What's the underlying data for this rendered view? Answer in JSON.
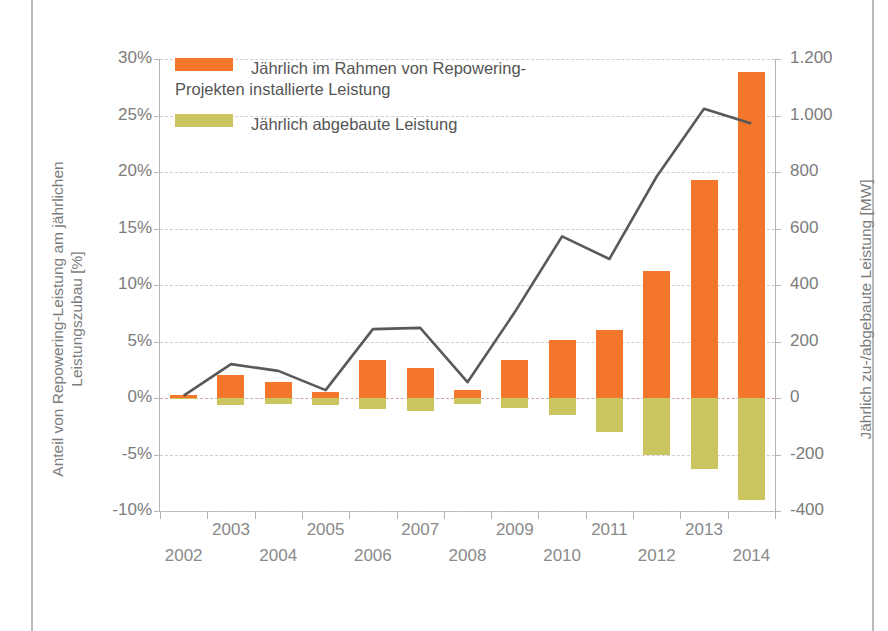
{
  "chart_data": {
    "type": "bar",
    "title": "",
    "subtitle": "",
    "categories": [
      "2002",
      "2003",
      "2004",
      "2005",
      "2006",
      "2007",
      "2008",
      "2009",
      "2010",
      "2011",
      "2012",
      "2013",
      "2014"
    ],
    "xlabel": "",
    "ylabel": "Anteil von Repowering-Leistung am jährlichen Leistungszubau [%]",
    "y2label": "Jährlich zu-/abgebaute Leistung [MW]",
    "ylim": [
      -10,
      30
    ],
    "y2lim": [
      -400,
      1200
    ],
    "yticks": [
      "30%",
      "25%",
      "20%",
      "15%",
      "10%",
      "5%",
      "0%",
      "-5%",
      "-10%"
    ],
    "ytick_values": [
      30,
      25,
      20,
      15,
      10,
      5,
      0,
      -5,
      -10
    ],
    "y2ticks": [
      "1.200",
      "1.000",
      "800",
      "600",
      "400",
      "200",
      "0",
      "-200",
      "-400"
    ],
    "y2tick_values": [
      1200,
      1000,
      800,
      600,
      400,
      200,
      0,
      -200,
      -400
    ],
    "grid": true,
    "legend_position": "top-left",
    "series": [
      {
        "name": "Jährlich im Rahmen von Repowering-Projekten installierte Leistung",
        "type": "bar",
        "axis": "right",
        "unit": "MW",
        "color": "#f4762a",
        "values": [
          10,
          80,
          55,
          20,
          135,
          105,
          30,
          135,
          205,
          240,
          450,
          770,
          1155
        ]
      },
      {
        "name": "Jährlich abgebaute Leistung",
        "type": "bar",
        "axis": "right",
        "unit": "MW",
        "color": "#cbc55f",
        "values": [
          -4,
          -25,
          -20,
          -25,
          -40,
          -45,
          -20,
          -35,
          -60,
          -120,
          -200,
          -250,
          -360
        ]
      },
      {
        "name": "Anteil von Repowering-Leistung am jährlichen Leistungszubau",
        "type": "line",
        "axis": "left",
        "unit": "%",
        "color": "#595959",
        "values": [
          0.2,
          3.0,
          2.4,
          0.7,
          6.1,
          6.2,
          1.4,
          7.6,
          14.3,
          12.3,
          19.6,
          25.6,
          24.3
        ]
      }
    ]
  },
  "legend": {
    "items": [
      {
        "label": "Jährlich im Rahmen von Repowering-\nProjekten installierte Leistung",
        "color": "#f4762a"
      },
      {
        "label": "Jährlich abgebaute Leistung",
        "color": "#cbc55f"
      }
    ]
  }
}
